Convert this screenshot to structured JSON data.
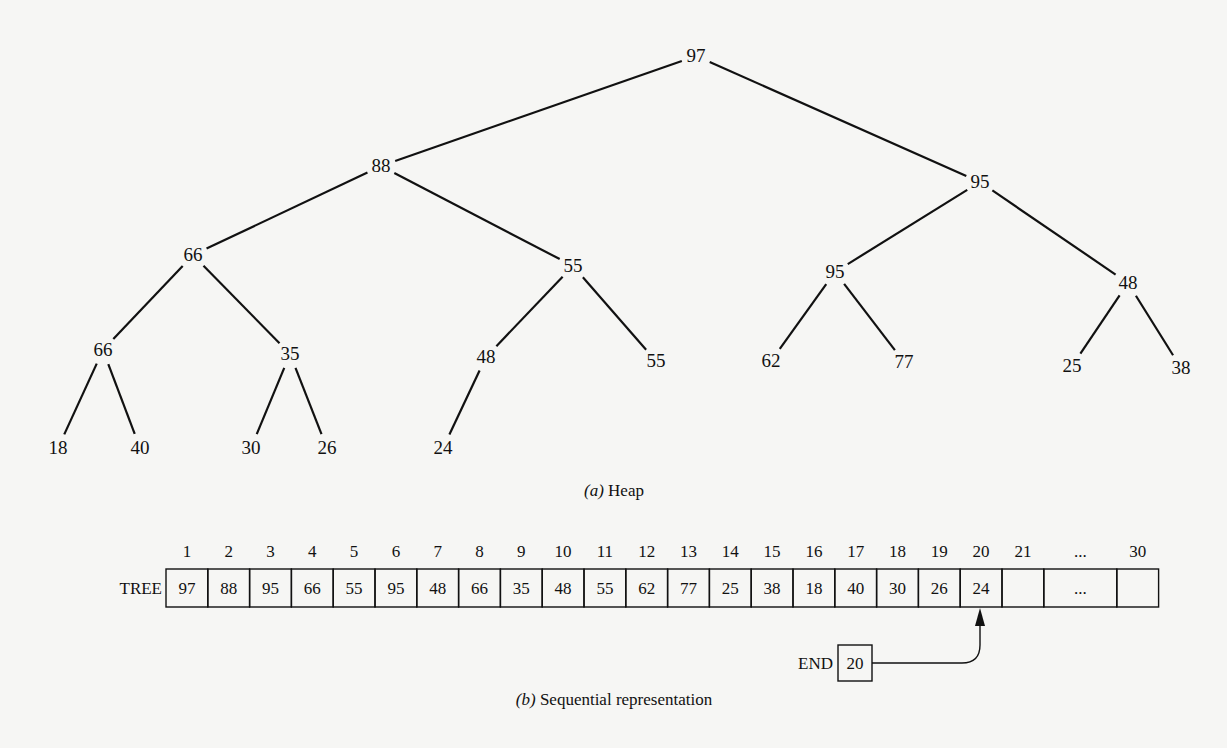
{
  "heap": {
    "caption_prefix": "(a)",
    "caption_text": " Heap",
    "nodes": [
      {
        "id": 1,
        "value": "97",
        "x": 696,
        "y": 62
      },
      {
        "id": 2,
        "value": "88",
        "x": 381,
        "y": 172
      },
      {
        "id": 3,
        "value": "95",
        "x": 980,
        "y": 188
      },
      {
        "id": 4,
        "value": "66",
        "x": 193,
        "y": 261
      },
      {
        "id": 5,
        "value": "55",
        "x": 573,
        "y": 272
      },
      {
        "id": 6,
        "value": "95",
        "x": 835,
        "y": 278
      },
      {
        "id": 7,
        "value": "48",
        "x": 1128,
        "y": 289
      },
      {
        "id": 8,
        "value": "66",
        "x": 103,
        "y": 356
      },
      {
        "id": 9,
        "value": "35",
        "x": 290,
        "y": 360
      },
      {
        "id": 10,
        "value": "48",
        "x": 486,
        "y": 363
      },
      {
        "id": 11,
        "value": "55",
        "x": 656,
        "y": 367
      },
      {
        "id": 12,
        "value": "62",
        "x": 771,
        "y": 367
      },
      {
        "id": 13,
        "value": "77",
        "x": 904,
        "y": 368
      },
      {
        "id": 14,
        "value": "25",
        "x": 1072,
        "y": 372
      },
      {
        "id": 15,
        "value": "38",
        "x": 1181,
        "y": 374
      },
      {
        "id": 16,
        "value": "18",
        "x": 58,
        "y": 454
      },
      {
        "id": 17,
        "value": "40",
        "x": 140,
        "y": 454
      },
      {
        "id": 18,
        "value": "30",
        "x": 251,
        "y": 454
      },
      {
        "id": 19,
        "value": "26",
        "x": 327,
        "y": 454
      },
      {
        "id": 20,
        "value": "24",
        "x": 443,
        "y": 454
      }
    ],
    "edges": [
      [
        1,
        2
      ],
      [
        1,
        3
      ],
      [
        2,
        4
      ],
      [
        2,
        5
      ],
      [
        3,
        6
      ],
      [
        3,
        7
      ],
      [
        4,
        8
      ],
      [
        4,
        9
      ],
      [
        5,
        10
      ],
      [
        5,
        11
      ],
      [
        6,
        12
      ],
      [
        6,
        13
      ],
      [
        7,
        14
      ],
      [
        7,
        15
      ],
      [
        8,
        16
      ],
      [
        8,
        17
      ],
      [
        9,
        18
      ],
      [
        9,
        19
      ],
      [
        10,
        20
      ]
    ]
  },
  "array": {
    "name_label": "TREE",
    "indices": [
      "1",
      "2",
      "3",
      "4",
      "5",
      "6",
      "7",
      "8",
      "9",
      "10",
      "11",
      "12",
      "13",
      "14",
      "15",
      "16",
      "17",
      "18",
      "19",
      "20",
      "21",
      "...",
      "30"
    ],
    "cells": [
      "97",
      "88",
      "95",
      "66",
      "55",
      "95",
      "48",
      "66",
      "35",
      "48",
      "55",
      "62",
      "77",
      "25",
      "38",
      "18",
      "40",
      "30",
      "26",
      "24",
      "",
      "...",
      ""
    ],
    "end_label": "END",
    "end_value": "20",
    "caption_prefix": "(b)",
    "caption_text": " Sequential representation"
  }
}
